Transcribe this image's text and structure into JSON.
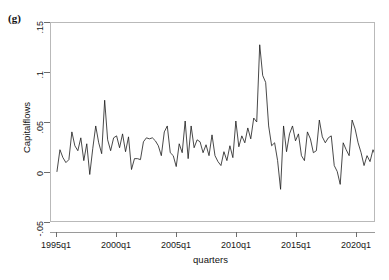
{
  "figure": {
    "panel_label": "(g)",
    "background_color": "#ffffff",
    "frame_color": "#b9b9b9",
    "line_color": "#1a1a1a"
  },
  "chart_data": {
    "type": "line",
    "title": "",
    "subtitle": "",
    "panel_label": "(g)",
    "xlabel": "quarters",
    "ylabel": "Capitalflows",
    "grid": false,
    "legend": null,
    "legend_position": "none",
    "xlim": [
      "1995q1",
      "2021q4"
    ],
    "ylim": [
      -0.05,
      0.15
    ],
    "ytick_labels": [
      "-.05",
      "0",
      ".05",
      ".1",
      ".15"
    ],
    "ytick_values": [
      -0.05,
      0,
      0.05,
      0.1,
      0.15
    ],
    "xtick_labels": [
      "1995q1",
      "2000q1",
      "2005q1",
      "2010q1",
      "2015q1",
      "2020q1"
    ],
    "xtick_values": [
      "1995q1",
      "2000q1",
      "2005q1",
      "2010q1",
      "2015q1",
      "2020q1"
    ],
    "series": [
      {
        "name": "Capitalflows",
        "color": "#1a1a1a",
        "x": [
          "1995q1",
          "1995q2",
          "1995q3",
          "1995q4",
          "1996q1",
          "1996q2",
          "1996q3",
          "1996q4",
          "1997q1",
          "1997q2",
          "1997q3",
          "1997q4",
          "1998q1",
          "1998q2",
          "1998q3",
          "1998q4",
          "1999q1",
          "1999q2",
          "1999q3",
          "1999q4",
          "2000q1",
          "2000q2",
          "2000q3",
          "2000q4",
          "2001q1",
          "2001q2",
          "2001q3",
          "2001q4",
          "2002q1",
          "2002q2",
          "2002q3",
          "2002q4",
          "2003q1",
          "2003q2",
          "2003q3",
          "2003q4",
          "2004q1",
          "2004q2",
          "2004q3",
          "2004q4",
          "2005q1",
          "2005q2",
          "2005q3",
          "2005q4",
          "2006q1",
          "2006q2",
          "2006q3",
          "2006q4",
          "2007q1",
          "2007q2",
          "2007q3",
          "2007q4",
          "2008q1",
          "2008q2",
          "2008q3",
          "2008q4",
          "2009q1",
          "2009q2",
          "2009q3",
          "2009q4",
          "2010q1",
          "2010q2",
          "2010q3",
          "2010q4",
          "2011q1",
          "2011q2",
          "2011q3",
          "2011q4",
          "2012q1",
          "2012q2",
          "2012q3",
          "2012q4",
          "2013q1",
          "2013q2",
          "2013q3",
          "2013q4",
          "2014q1",
          "2014q2",
          "2014q3",
          "2014q4",
          "2015q1",
          "2015q2",
          "2015q3",
          "2015q4",
          "2016q1",
          "2016q2",
          "2016q3",
          "2016q4",
          "2017q1",
          "2017q2",
          "2017q3",
          "2017q4",
          "2018q1",
          "2018q2",
          "2018q3",
          "2018q4",
          "2019q1",
          "2019q2",
          "2019q3",
          "2019q4",
          "2020q1",
          "2020q2",
          "2020q3",
          "2020q4",
          "2021q1",
          "2021q2",
          "2021q3",
          "2021q4"
        ],
        "values": [
          0.0,
          0.022,
          0.014,
          0.009,
          0.012,
          0.04,
          0.026,
          0.021,
          0.034,
          0.011,
          0.028,
          -0.003,
          0.023,
          0.046,
          0.029,
          0.018,
          0.072,
          0.032,
          0.021,
          0.034,
          0.036,
          0.024,
          0.038,
          0.02,
          0.035,
          0.002,
          0.013,
          0.013,
          0.012,
          0.03,
          0.034,
          0.033,
          0.034,
          0.031,
          0.026,
          0.016,
          0.04,
          0.046,
          0.019,
          0.016,
          0.005,
          0.028,
          0.019,
          0.051,
          0.013,
          0.046,
          0.024,
          0.032,
          0.03,
          0.019,
          0.027,
          0.016,
          0.037,
          0.016,
          0.01,
          0.006,
          0.02,
          0.011,
          0.026,
          0.014,
          0.051,
          0.025,
          0.036,
          0.029,
          0.044,
          0.033,
          0.054,
          0.05,
          0.128,
          0.097,
          0.09,
          0.046,
          0.026,
          0.029,
          0.011,
          -0.018,
          0.046,
          0.02,
          0.038,
          0.046,
          0.031,
          0.038,
          0.016,
          0.011,
          0.04,
          0.033,
          0.019,
          0.021,
          0.052,
          0.035,
          0.029,
          0.034,
          0.036,
          0.006,
          0.0,
          -0.013,
          0.029,
          0.022,
          0.016,
          0.052,
          0.043,
          0.029,
          0.019,
          0.006,
          0.016,
          0.01,
          0.022,
          0.015
        ]
      }
    ],
    "annotations": [
      {
        "text": "(g)",
        "role": "panel-label"
      }
    ]
  }
}
